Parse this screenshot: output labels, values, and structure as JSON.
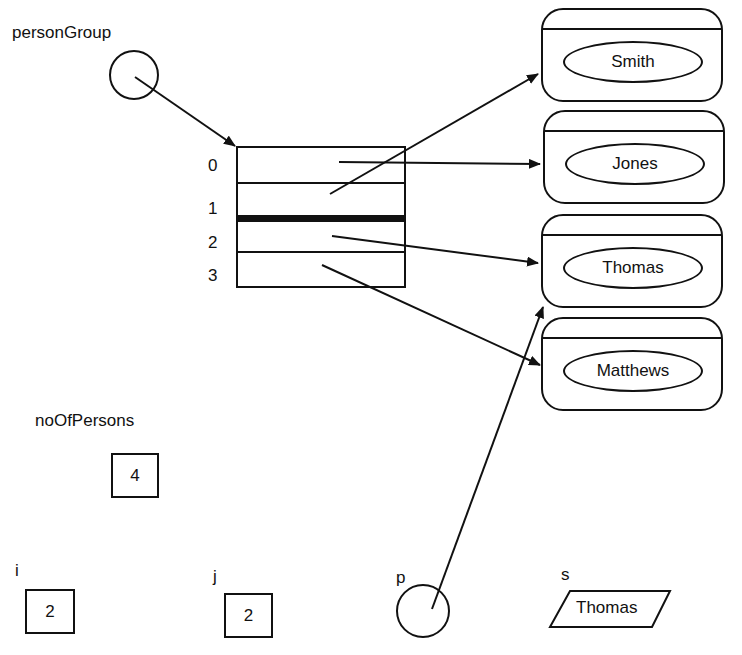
{
  "variables": {
    "personGroup": {
      "label": "personGroup"
    },
    "noOfPersons": {
      "label": "noOfPersons",
      "value": "4"
    },
    "i": {
      "label": "i",
      "value": "2"
    },
    "j": {
      "label": "j",
      "value": "2"
    },
    "p": {
      "label": "p"
    },
    "s": {
      "label": "s",
      "value": "Thomas"
    }
  },
  "array": {
    "indices": [
      "0",
      "1",
      "2",
      "3"
    ]
  },
  "objects": [
    {
      "name": "Smith"
    },
    {
      "name": "Jones"
    },
    {
      "name": "Thomas"
    },
    {
      "name": "Matthews"
    }
  ],
  "colors": {
    "ink": "#111111",
    "background": "#ffffff"
  }
}
